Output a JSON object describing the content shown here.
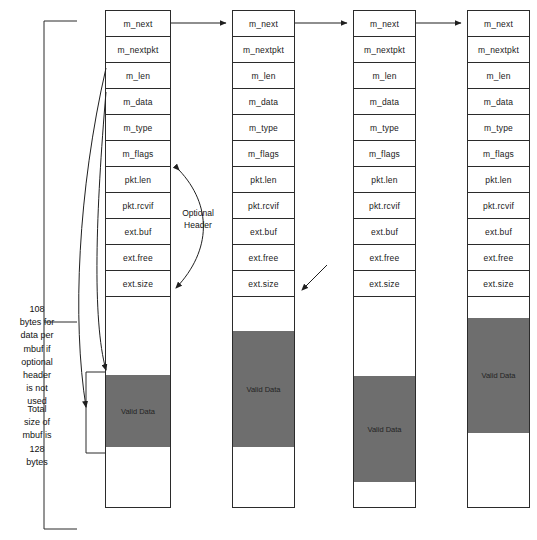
{
  "diagram": {
    "field_labels": [
      "m_next",
      "m_nextpkt",
      "m_len",
      "m_data",
      "m_type",
      "m_flags",
      "pkt.len",
      "pkt.rcvif",
      "ext.buf",
      "ext.free",
      "ext.size"
    ],
    "valid_data_label": "Valid Data",
    "optional_header_label": "Optional\nHeader",
    "annotation_bytes_per_mbuf": "108\nbytes for\ndata per\nmbuf if\noptional\nheader\nis not\nused",
    "annotation_total_size": "Total\nsize of\nmbuf is\n128\nbytes",
    "colors": {
      "valid_data_fill": "#6e6e6e",
      "stroke": "#2b2b2b",
      "background": "#ffffff",
      "text": "#111111"
    },
    "columns": [
      {
        "id": "mbuf-1",
        "fields": [
          "m_next",
          "m_nextpkt",
          "m_len",
          "m_data",
          "m_type",
          "m_flags",
          "pkt.len",
          "pkt.rcvif",
          "ext.buf",
          "ext.free",
          "ext.size"
        ],
        "valid_data_label": "Valid Data"
      },
      {
        "id": "mbuf-2",
        "fields": [
          "m_next",
          "m_nextpkt",
          "m_len",
          "m_data",
          "m_type",
          "m_flags",
          "pkt.len",
          "pkt.rcvif",
          "ext.buf",
          "ext.free",
          "ext.size"
        ],
        "valid_data_label": "Valid Data"
      },
      {
        "id": "mbuf-3",
        "fields": [
          "m_next",
          "m_nextpkt",
          "m_len",
          "m_data",
          "m_type",
          "m_flags",
          "pkt.len",
          "pkt.rcvif",
          "ext.buf",
          "ext.free",
          "ext.size"
        ],
        "valid_data_label": "Valid Data"
      },
      {
        "id": "mbuf-4",
        "fields": [
          "m_next",
          "m_nextpkt",
          "m_len",
          "m_data",
          "m_type",
          "m_flags",
          "pkt.len",
          "pkt.rcvif",
          "ext.buf",
          "ext.free",
          "ext.size"
        ],
        "valid_data_label": "Valid Data"
      }
    ]
  }
}
